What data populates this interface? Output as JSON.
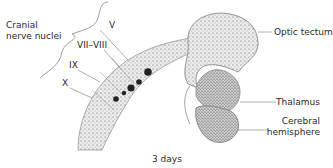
{
  "diagram": {
    "caption": "3 days",
    "group_label": {
      "line1": "Cranial",
      "line2": "nerve nuclei"
    },
    "nerve_labels": [
      "V",
      "VII–VIII",
      "IX",
      "X"
    ],
    "structure_labels": {
      "optic_tectum": "Optic tectum",
      "thalamus": "Thalamus",
      "cerebral_line1": "Cerebral",
      "cerebral_line2": "hemisphere"
    },
    "colors": {
      "ink": "#2a2a2a",
      "stipple": "#555555",
      "leader": "#777777",
      "fill": "#e8e8e8"
    }
  }
}
